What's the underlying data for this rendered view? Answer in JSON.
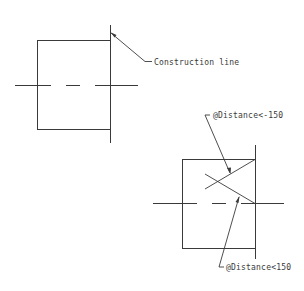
{
  "figure_top": {
    "annotation": "Construction line",
    "rectangle": {
      "x1": 37,
      "y1": 40,
      "x2": 110,
      "y2": 129
    },
    "construction_line": {
      "x": 110,
      "y1": 25,
      "y2": 143
    },
    "centerline_y": 85
  },
  "figure_bottom": {
    "annotation_upper": "@Distance<-150",
    "annotation_lower": "@Distance<150",
    "rectangle": {
      "x1": 182,
      "y1": 159,
      "x2": 255,
      "y2": 248
    },
    "construction_line": {
      "x": 255,
      "y1": 145,
      "y2": 259
    },
    "centerline_y": 203
  },
  "colors": {
    "line": "#3a3a3a",
    "background": "#ffffff"
  }
}
